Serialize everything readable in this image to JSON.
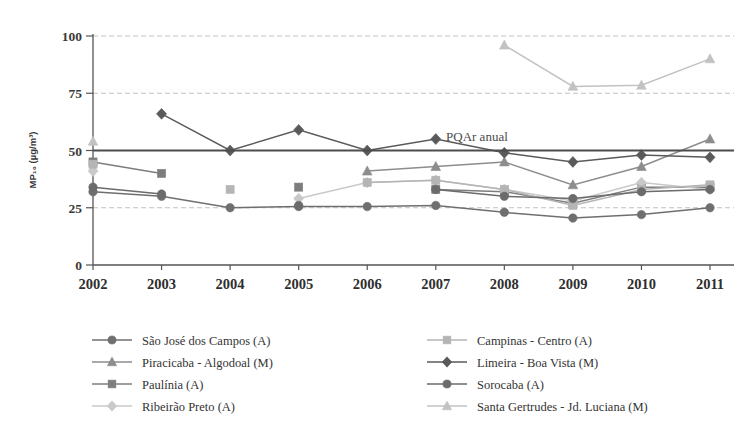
{
  "chart_data": {
    "type": "line",
    "title": "",
    "xlabel": "",
    "ylabel": "MP₁₀ (µg/m³)",
    "x": [
      2002,
      2003,
      2004,
      2005,
      2006,
      2007,
      2008,
      2009,
      2010,
      2011
    ],
    "xtick_labels": [
      "2002",
      "2003",
      "2004",
      "2005",
      "2006",
      "2007",
      "2008",
      "2009",
      "2010",
      "2011"
    ],
    "ytick_labels": [
      "0",
      "25",
      "50",
      "75",
      "100"
    ],
    "yticks": [
      0,
      25,
      50,
      75,
      100
    ],
    "ylim": [
      0,
      100
    ],
    "grid": true,
    "legend_position": "bottom",
    "annotations": [
      {
        "text": "PQAr anual",
        "x": 2007.6,
        "y": 50,
        "kind": "reference-line-label"
      }
    ],
    "reference_lines": [
      {
        "value": 50,
        "label": "PQAr anual",
        "color": "#4d4d4d"
      }
    ],
    "series": [
      {
        "name": "São José dos Campos (A)",
        "marker": "circle",
        "color": "#6f6f6f",
        "values": [
          32,
          30,
          25,
          25.5,
          25.5,
          26,
          23,
          20.5,
          22,
          25
        ]
      },
      {
        "name": "Piracicaba - Algodoal (M)",
        "marker": "triangle",
        "color": "#8d8d8d",
        "values": [
          null,
          null,
          null,
          null,
          41,
          43,
          45,
          35,
          43,
          55
        ]
      },
      {
        "name": "Paulínia (A)",
        "marker": "square",
        "color": "#7d7d7d",
        "values": [
          45,
          40,
          null,
          34,
          null,
          33,
          32,
          27,
          34,
          34
        ]
      },
      {
        "name": "Ribeirão Preto (A)",
        "marker": "diamond",
        "color": "#c9c9c9",
        "values": [
          41,
          null,
          null,
          29,
          36,
          37,
          33,
          28,
          36,
          33
        ]
      },
      {
        "name": "Campinas - Centro (A)",
        "marker": "square",
        "color": "#b5b5b5",
        "values": [
          44,
          null,
          33,
          null,
          36,
          37,
          33,
          26,
          33,
          35
        ]
      },
      {
        "name": "Limeira - Boa Vista (M)",
        "marker": "diamond",
        "color": "#5a5a5a",
        "values": [
          null,
          66,
          50,
          59,
          50,
          55,
          49,
          45,
          48,
          47
        ]
      },
      {
        "name": "Sorocaba (A)",
        "marker": "circle",
        "color": "#6b6b6b",
        "values": [
          34,
          31,
          null,
          26,
          null,
          33,
          30,
          29,
          32,
          33
        ]
      },
      {
        "name": "Santa Gertrudes - Jd. Luciana (M)",
        "marker": "triangle",
        "color": "#c2c2c2",
        "values": [
          54,
          null,
          null,
          null,
          null,
          null,
          96,
          78,
          78.5,
          90
        ]
      }
    ]
  },
  "legend": {
    "columns": [
      [
        {
          "label": "São José dos Campos (A)",
          "marker": "circle",
          "color": "#6f6f6f"
        },
        {
          "label": "Piracicaba - Algodoal (M)",
          "marker": "triangle",
          "color": "#8d8d8d"
        },
        {
          "label": "Paulínia (A)",
          "marker": "square",
          "color": "#7d7d7d"
        },
        {
          "label": "Ribeirão Preto (A)",
          "marker": "diamond",
          "color": "#c9c9c9"
        }
      ],
      [
        {
          "label": "Campinas - Centro (A)",
          "marker": "square",
          "color": "#b5b5b5"
        },
        {
          "label": "Limeira - Boa Vista (M)",
          "marker": "diamond",
          "color": "#5a5a5a"
        },
        {
          "label": "Sorocaba (A)",
          "marker": "circle",
          "color": "#6b6b6b"
        },
        {
          "label": "Santa Gertrudes - Jd. Luciana (M)",
          "marker": "triangle",
          "color": "#c2c2c2"
        }
      ]
    ]
  },
  "colors": {
    "background": "#ffffff",
    "axis": "#555555",
    "grid": "#b9b9b9",
    "text": "#333333"
  }
}
